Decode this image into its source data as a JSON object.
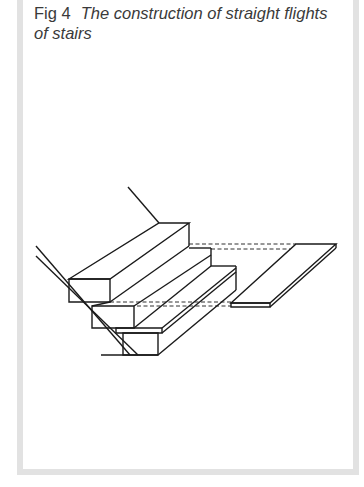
{
  "figure": {
    "label": "Fig 4",
    "title": "The construction of straight flights of stairs"
  },
  "colors": {
    "frame": "#e2e2e2",
    "line": "#1a1a1a",
    "text": "#3a3a3a"
  }
}
